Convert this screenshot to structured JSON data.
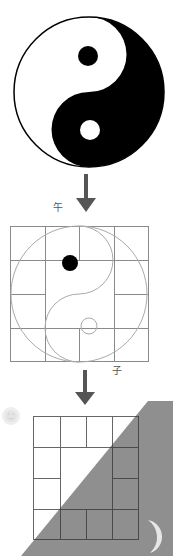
{
  "diagram": {
    "panels": [
      {
        "id": "taiji",
        "description": "Yin-yang (taiji) symbol"
      },
      {
        "id": "grid-taiji",
        "description": "Taiji curve overlaid on 4x4 grid"
      },
      {
        "id": "grid-shadow",
        "description": "4x4 grid with diagonal shaded half, sun and moon"
      }
    ],
    "labels": {
      "wu": "午",
      "zi": "子"
    },
    "icons": {
      "sun": "sun-face-icon",
      "moon": "crescent-moon-icon",
      "arrow": "arrow-down-icon"
    },
    "colors": {
      "black": "#000000",
      "white": "#ffffff",
      "grid_line": "#888888",
      "grid_line_dark": "#333333",
      "curve": "#aaaaaa",
      "shade": "#8f8f8f",
      "arrow": "#555555",
      "moon": "#e6e6e6",
      "sun": "#eeeeee"
    }
  }
}
